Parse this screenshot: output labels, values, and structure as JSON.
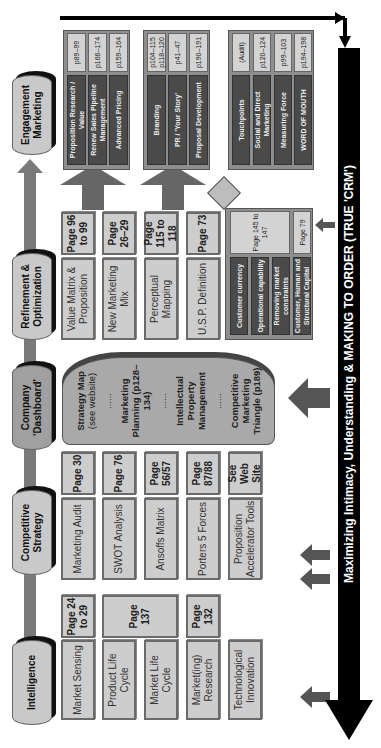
{
  "stages": [
    {
      "label": "Intelligence"
    },
    {
      "label": "Competitive Strategy"
    },
    {
      "label": "Company 'Dashboard'"
    },
    {
      "label": "Refinement & Optimization"
    },
    {
      "label": "Engagement Marketing"
    }
  ],
  "intelligence": {
    "items": [
      {
        "label": "Market Sensing",
        "page": "Page 24 to 29"
      },
      {
        "label": "Product Life Cycle"
      },
      {
        "label": "Market Life Cycle"
      },
      {
        "label": "Market(ing) Research",
        "page": "Page 132"
      },
      {
        "label": "Technological Innovation"
      }
    ],
    "shared_page": "Page 137"
  },
  "competitive": {
    "items": [
      {
        "label": "Marketing Audit",
        "page": "Page 30"
      },
      {
        "label": "SWOT Analysis",
        "page": "Page 76"
      },
      {
        "label": "Ansoffs Matrix",
        "page": "Page 56/57"
      },
      {
        "label": "Porters 5 Forces",
        "page": "Page 87/88"
      },
      {
        "label": "Proposition Accelerator Tools",
        "page": "See Web Site"
      }
    ]
  },
  "dashboard": {
    "items": [
      {
        "title": "Strategy Map",
        "sub": "(see website)"
      },
      {
        "title": "Marketing Planning (p128–134)"
      },
      {
        "title": "Intellectual Property Management"
      },
      {
        "title": "Competitive Marketing Triangle (p189)"
      }
    ],
    "separator": "......"
  },
  "refinement": {
    "items": [
      {
        "label": "Value Matrix & Proposition",
        "page": "Page 96 to 99"
      },
      {
        "label": "New Marketing Mix",
        "page": "Page 26–29"
      },
      {
        "label": "Perceptual Mapping",
        "page": "Page 115 to 118"
      },
      {
        "label": "U.S.P. Definition",
        "page": "Page 73"
      }
    ],
    "capital": {
      "items": [
        "Customer currency",
        "Operational capability",
        "Removing market constraints",
        "Customer, Human and Structural Capital"
      ],
      "page_main": "Page 145 to 147",
      "page_side": "Page 79"
    }
  },
  "engagement": {
    "groups": [
      {
        "items": [
          {
            "label": "Proposition Research / Value",
            "page": "p89–99"
          },
          {
            "label": "Renew Sales Pipeline Management",
            "page": "p166–174"
          },
          {
            "label": "Advanced Pricing",
            "page": "p159–164"
          }
        ]
      },
      {
        "items": [
          {
            "label": "Branding",
            "page": "p104–115 p118–120"
          },
          {
            "label": "PR / 'Your Story'",
            "page": "p41–47"
          },
          {
            "label": "Proposal Development",
            "page": "p190–191"
          }
        ]
      },
      {
        "items": [
          {
            "label": "Touchpoints",
            "page": "(Audit)"
          },
          {
            "label": "Social and Direct Marketing",
            "page": "p120–124"
          },
          {
            "label": "Measuring Force",
            "page": "p99–103"
          },
          {
            "label": "WORD OF MOUTH",
            "page": "p194–198"
          }
        ]
      }
    ]
  },
  "banner": {
    "label": "Maximizing Intimacy, Understanding & MAKING TO ORDER (TRUE 'CRM')"
  },
  "colors": {
    "box": "#cdcdcd",
    "dark": "#4a4a4a",
    "banner": "#000000",
    "arrow": "#555555"
  }
}
